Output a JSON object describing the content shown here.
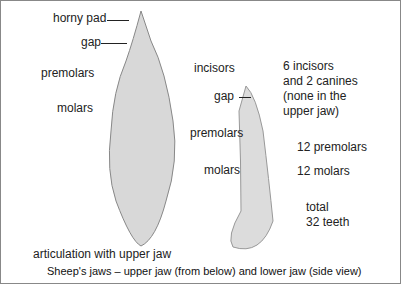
{
  "upper_jaw_labels": {
    "horny_pad": "horny pad",
    "gap": "gap",
    "premolars": "premolars",
    "molars": "molars"
  },
  "lower_jaw_labels": {
    "incisors": "incisors",
    "gap": "gap",
    "premolars": "premolars",
    "molars": "molars",
    "articulation": "articulation with upper jaw"
  },
  "notes": {
    "incisors_1": "6 incisors",
    "incisors_2": "and 2 canines",
    "incisors_3": "(none in the",
    "incisors_4": "upper jaw)",
    "premolars": "12 premolars",
    "molars": "12 molars",
    "total_1": "total",
    "total_2": "32 teeth"
  },
  "caption": "Sheep's jaws – upper jaw (from below) and lower jaw (side view)"
}
